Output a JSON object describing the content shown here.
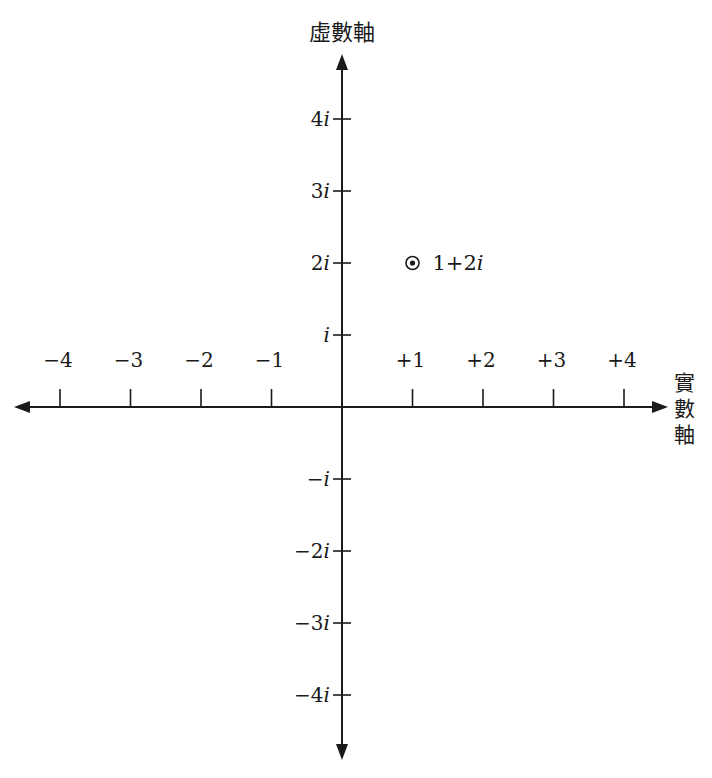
{
  "diagram": {
    "type": "complex-plane",
    "imaginary_axis_label": "虛數軸",
    "real_axis_label": [
      "實",
      "數",
      "軸"
    ],
    "real_ticks": [
      {
        "value": -4,
        "label": "−4"
      },
      {
        "value": -3,
        "label": "−3"
      },
      {
        "value": -2,
        "label": "−2"
      },
      {
        "value": -1,
        "label": "−1"
      },
      {
        "value": 1,
        "label": "+1"
      },
      {
        "value": 2,
        "label": "+2"
      },
      {
        "value": 3,
        "label": "+3"
      },
      {
        "value": 4,
        "label": "+4"
      }
    ],
    "imaginary_ticks": [
      {
        "value": 4,
        "coef": "4",
        "label": "4i"
      },
      {
        "value": 3,
        "coef": "3",
        "label": "3i"
      },
      {
        "value": 2,
        "coef": "2",
        "label": "2i"
      },
      {
        "value": 1,
        "coef": "",
        "label": "i"
      },
      {
        "value": -1,
        "coef": "−",
        "label": "−i"
      },
      {
        "value": -2,
        "coef": "−2",
        "label": "−2i"
      },
      {
        "value": -3,
        "coef": "−3",
        "label": "−3i"
      },
      {
        "value": -4,
        "coef": "−4",
        "label": "−4i"
      }
    ],
    "imag_unit": "i",
    "point": {
      "re": 1,
      "im": 2,
      "label_real": "1+2",
      "label_imag": "i",
      "label": "1+2i",
      "marker": "circled-dot"
    },
    "colors": {
      "ink": "#1a1a1a",
      "background": "#ffffff"
    }
  }
}
